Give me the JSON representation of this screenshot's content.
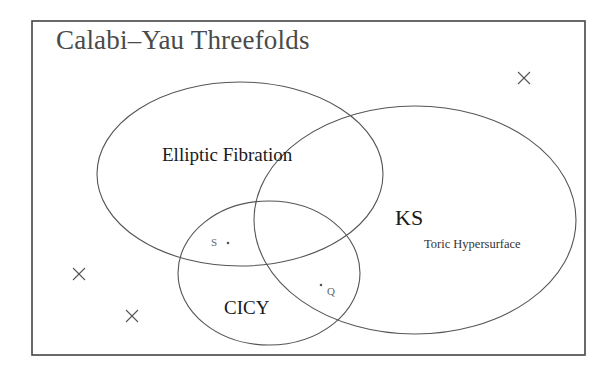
{
  "diagram": {
    "title": "Calabi–Yau Threefolds",
    "frame": {
      "x": 32,
      "y": 21,
      "width": 553,
      "height": 334
    },
    "line_color": "#555555",
    "sets": [
      {
        "id": "elliptic",
        "label": "Elliptic Fibration",
        "cx": 240,
        "cy": 174,
        "rx": 143,
        "ry": 92
      },
      {
        "id": "ks",
        "label": "KS",
        "sublabel": "Toric Hypersurface",
        "cx": 415,
        "cy": 220,
        "rx": 161,
        "ry": 114
      },
      {
        "id": "cicy",
        "label": "CICY",
        "cx": 269,
        "cy": 273,
        "rx": 91,
        "ry": 72
      }
    ],
    "points": [
      {
        "label": "S",
        "x": 228,
        "y": 243
      },
      {
        "label": "Q",
        "x": 321,
        "y": 285
      }
    ],
    "outliers": [
      {
        "marker": "×",
        "x": 524,
        "y": 78
      },
      {
        "marker": "×",
        "x": 79,
        "y": 274
      },
      {
        "marker": "×",
        "x": 132,
        "y": 316
      }
    ]
  }
}
